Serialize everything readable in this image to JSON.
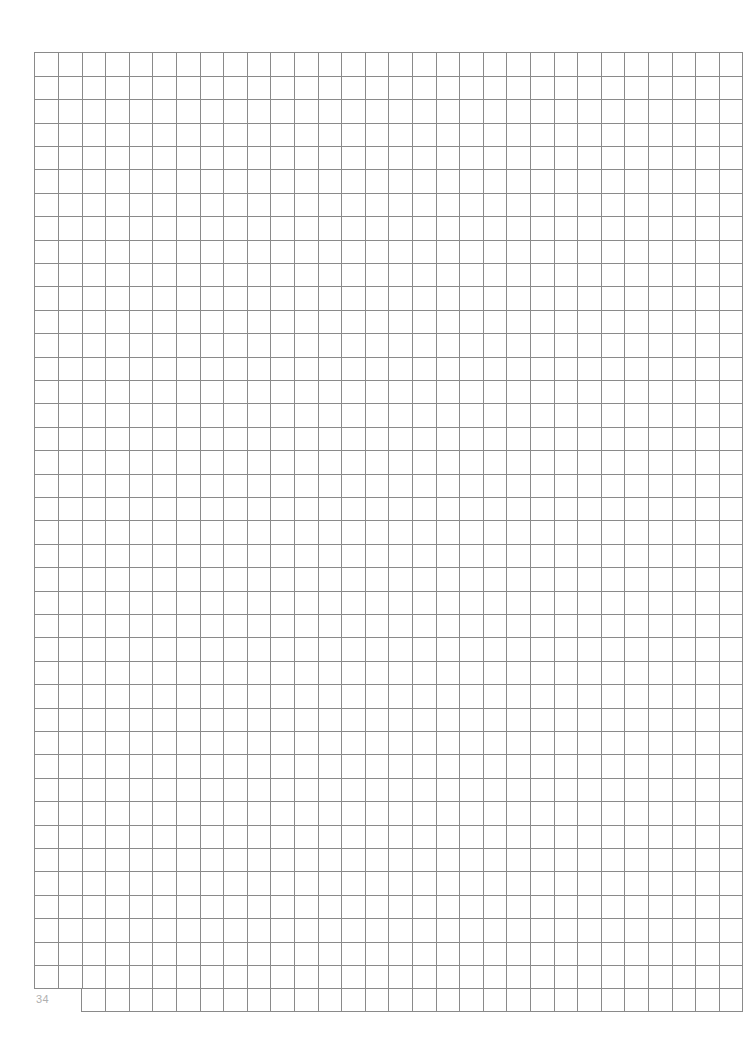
{
  "page": {
    "type": "graph-paper",
    "page_number": "34",
    "grid": {
      "left": 34,
      "top": 52,
      "columns": 30,
      "rows": 40,
      "cell_width": 23.6,
      "cell_height": 23.4,
      "line_color": "#8a8a8a"
    },
    "extra_row": {
      "start_column": 2,
      "columns": 28
    },
    "background": "#ffffff"
  }
}
